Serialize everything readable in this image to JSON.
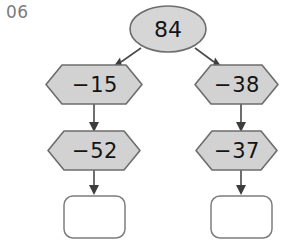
{
  "page": {
    "exercise_number": "06",
    "background_color": "#ffffff",
    "width": 284,
    "height": 240
  },
  "diagram": {
    "type": "flowchart-tree",
    "colors": {
      "shape_fill": "#d2d2d2",
      "shape_stroke": "#6d6d6d",
      "box_fill": "#ffffff",
      "box_stroke": "#7d7d7d",
      "connector": "#4a4a4a",
      "text": "#141414",
      "label_gray": "#7b7b7b"
    },
    "root": {
      "id": "start",
      "shape": "ellipse",
      "value": "84"
    },
    "branches": [
      {
        "id": "left-branch",
        "side": "left",
        "steps": [
          {
            "id": "left-step-1",
            "shape": "hexagon",
            "value": "−15"
          },
          {
            "id": "left-step-2",
            "shape": "hexagon",
            "value": "−52"
          }
        ],
        "result": {
          "id": "left-result",
          "shape": "rounded-box",
          "value": ""
        }
      },
      {
        "id": "right-branch",
        "side": "right",
        "steps": [
          {
            "id": "right-step-1",
            "shape": "hexagon",
            "value": "−38"
          },
          {
            "id": "right-step-2",
            "shape": "hexagon",
            "value": "−37"
          }
        ],
        "result": {
          "id": "right-result",
          "shape": "rounded-box",
          "value": ""
        }
      }
    ]
  }
}
